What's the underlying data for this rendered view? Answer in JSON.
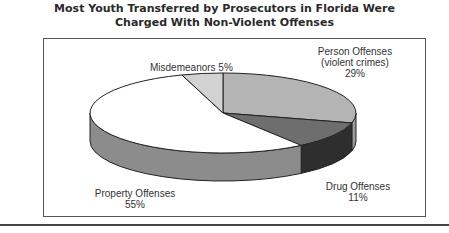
{
  "chart_data": {
    "type": "pie",
    "title": "Most Youth Transferred by Prosecutors in Florida Were Charged With Non-Violent Offenses",
    "title_lines": [
      "Most Youth Transferred by Prosecutors in Florida Were",
      "Charged With Non-Violent Offenses"
    ],
    "style": "3d",
    "categories": [
      "Person Offenses (violent crimes)",
      "Drug Offenses",
      "Property Offenses",
      "Misdemeanors"
    ],
    "values": [
      29,
      11,
      55,
      5
    ],
    "unit": "%",
    "colors": [
      "#b4b4b4",
      "#6e6e6e",
      "#ffffff",
      "#d2d2d2"
    ],
    "side_colors": [
      "#9a9a9a",
      "#2e2e2e",
      "#8c8c8c",
      "#b0b0b0"
    ],
    "legend": "none (direct labels)"
  },
  "labels": {
    "person": {
      "line1": "Person Offenses",
      "line2": "(violent crimes)",
      "line3": "29%"
    },
    "drug": {
      "line1": "Drug Offenses",
      "line2": "11%"
    },
    "property": {
      "line1": "Property Offenses",
      "line2": "55%"
    },
    "misdemeanors": {
      "line1": "Misdemeanors 5%"
    }
  }
}
